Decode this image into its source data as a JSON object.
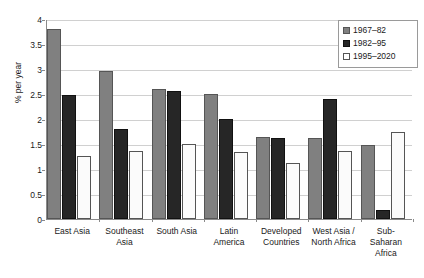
{
  "chart_data": {
    "type": "bar",
    "title": "",
    "xlabel": "",
    "ylabel": "% per year",
    "ylim": [
      0,
      4
    ],
    "ytick_values": [
      0,
      0.5,
      1,
      1.5,
      2,
      2.5,
      3,
      3.5,
      4
    ],
    "ytick_labels": [
      "0",
      "0.5",
      "1",
      "1.5",
      "2",
      "2.5",
      "3",
      "3.5",
      "4"
    ],
    "grid": true,
    "legend_position": "top-right",
    "categories": [
      "East Asia",
      "Southeast Asia",
      "South Asia",
      "Latin America",
      "Developed Countries",
      "West Asia / North Africa",
      "Sub-Saharan Africa"
    ],
    "category_lines": [
      [
        "East Asia"
      ],
      [
        "Southeast",
        "Asia"
      ],
      [
        "South Asia"
      ],
      [
        "Latin",
        "America"
      ],
      [
        "Developed",
        "Countries"
      ],
      [
        "West Asia /",
        "North Africa"
      ],
      [
        "Sub-",
        "Saharan",
        "Africa"
      ]
    ],
    "series": [
      {
        "name": "1967–82",
        "color": "#808080",
        "values": [
          3.8,
          2.96,
          2.6,
          2.5,
          1.64,
          1.62,
          1.49
        ]
      },
      {
        "name": "1982–95",
        "color": "#262626",
        "values": [
          2.48,
          1.8,
          2.56,
          2.0,
          1.62,
          2.4,
          0.18
        ]
      },
      {
        "name": "1995–2020",
        "color": "#ffffff",
        "values": [
          1.26,
          1.37,
          1.51,
          1.34,
          1.13,
          1.37,
          1.75
        ]
      }
    ]
  },
  "legend": {
    "items": [
      {
        "label": "1967–82",
        "swatch": "legend-swatch-gray"
      },
      {
        "label": "1982–95",
        "swatch": "legend-swatch-black"
      },
      {
        "label": "1995–2020",
        "swatch": "legend-swatch-white"
      }
    ]
  }
}
